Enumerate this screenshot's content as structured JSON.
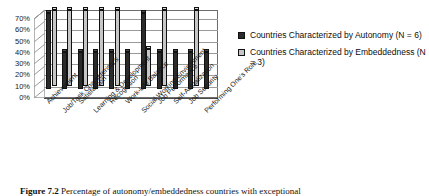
{
  "chart_data": {
    "type": "bar",
    "title": "",
    "xlabel": "",
    "ylabel": "",
    "ylim": [
      0,
      70
    ],
    "ytick_labels": [
      "70%",
      "60%",
      "50%",
      "40%",
      "30%",
      "20%",
      "10%",
      "0%"
    ],
    "ytick_values": [
      70,
      60,
      50,
      40,
      30,
      20,
      10,
      0
    ],
    "grid": true,
    "legend_position": "right",
    "style": "3d-column",
    "categories": [
      "Achievement",
      "Job/Task Characteristics",
      "Satisfaction",
      "Learning & Development",
      "Recognition",
      "Work-Life Balance",
      "Social Working Environment",
      "Job Performance",
      "Self-Actualization",
      "Job Security",
      "Performing One's Role"
    ],
    "series": [
      {
        "name": "Countries Characterized by Autonomy (N = 6)",
        "color": "#2b2b2b",
        "values": [
          67,
          33,
          33,
          33,
          33,
          33,
          67,
          33,
          33,
          33,
          33
        ]
      },
      {
        "name": "Countries Characterized by Embeddedness (N = 3)",
        "color": "#c6c6c6",
        "values": [
          67,
          67,
          67,
          67,
          67,
          0,
          33,
          67,
          0,
          67,
          0
        ]
      }
    ]
  },
  "legend": {
    "items": [
      {
        "label": "Countries Characterized by Autonomy (N = 6)",
        "color": "#2b2b2b"
      },
      {
        "label": "Countries Characterized by Embeddedness (N = 3)",
        "color": "#c6c6c6"
      }
    ]
  },
  "caption": {
    "number": "Figure 7.2",
    "text": "Percentage of autonomy/embeddedness countries with exceptional"
  }
}
